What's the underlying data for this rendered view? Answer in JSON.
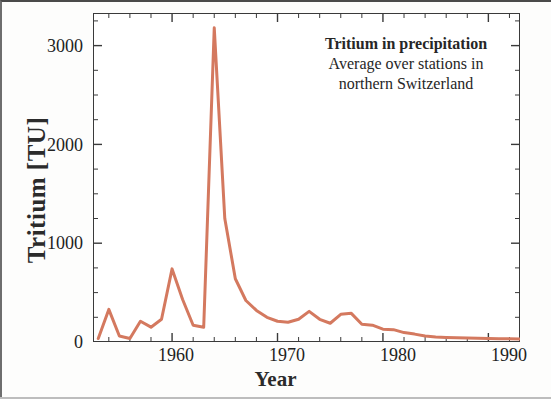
{
  "figure": {
    "y_axis_title": "Tritium [TU]",
    "x_axis_title": "Year"
  },
  "annotation": {
    "title": "Tritium in precipitation",
    "line2": "Average over stations in",
    "line3": "northern Switzerland"
  },
  "ticks": {
    "y": [
      "0",
      "1000",
      "2000",
      "3000"
    ],
    "x": [
      "1960",
      "1970",
      "1980",
      "1990"
    ]
  },
  "chart_data": {
    "type": "line",
    "title": "Tritium in precipitation",
    "subtitle": "Average over stations in northern Switzerland",
    "xlabel": "Year",
    "ylabel": "Tritium [TU]",
    "xlim": [
      1952.5,
      1993.0
    ],
    "ylim": [
      0,
      3330
    ],
    "xticks": [
      1960,
      1970,
      1980,
      1990
    ],
    "yticks": [
      0,
      1000,
      2000,
      3000
    ],
    "xminor_step": 2,
    "yminor_step": 250,
    "grid": false,
    "legend": null,
    "line_color": "#d4795f",
    "line_width": 3.0,
    "series": [
      {
        "name": "Tritium in precipitation (northern Switzerland)",
        "x": [
          1953,
          1954,
          1955,
          1956,
          1957,
          1958,
          1959,
          1960,
          1961,
          1962,
          1963,
          1964,
          1965,
          1966,
          1967,
          1968,
          1969,
          1970,
          1971,
          1972,
          1973,
          1974,
          1975,
          1976,
          1977,
          1978,
          1979,
          1980,
          1981,
          1982,
          1983,
          1984,
          1985,
          1986,
          1987,
          1988,
          1989,
          1990,
          1991,
          1992,
          1993
        ],
        "values": [
          35,
          330,
          60,
          35,
          210,
          150,
          230,
          740,
          430,
          170,
          150,
          3180,
          1250,
          640,
          420,
          320,
          250,
          210,
          200,
          230,
          310,
          230,
          190,
          280,
          290,
          180,
          170,
          130,
          125,
          95,
          80,
          60,
          50,
          45,
          42,
          40,
          38,
          36,
          34,
          32,
          30
        ]
      }
    ],
    "annotations": [
      {
        "text": "Peak 1963 (bomb-test maximum)",
        "x": 1964,
        "y": 3180
      }
    ]
  }
}
